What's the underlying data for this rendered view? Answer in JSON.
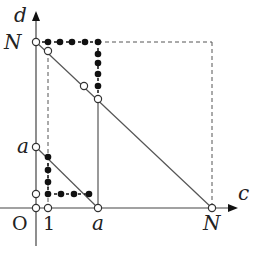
{
  "diagram": {
    "axes": {
      "x_label": "c",
      "y_label": "d",
      "origin_label": "O"
    },
    "tick_labels": {
      "x": [
        {
          "label": "1",
          "italic": false
        },
        {
          "label": "a",
          "italic": true
        },
        {
          "label": "N",
          "italic": true
        }
      ],
      "y": [
        {
          "label": "a",
          "italic": true
        },
        {
          "label": "N",
          "italic": true
        }
      ]
    },
    "lines": [
      {
        "name": "diagonal-N",
        "from": [
          "0",
          "N"
        ],
        "to": [
          "N",
          "0"
        ],
        "style": "solid"
      },
      {
        "name": "diagonal-a",
        "from": [
          "0",
          "a"
        ],
        "to": [
          "a",
          "0"
        ],
        "style": "solid"
      },
      {
        "name": "vertical-a",
        "from": [
          "a",
          "0"
        ],
        "to": [
          "a",
          "N-a"
        ],
        "style": "solid"
      },
      {
        "name": "box-top",
        "at": "d=N",
        "style": "dashed"
      },
      {
        "name": "box-right",
        "at": "c=N",
        "style": "dashed"
      },
      {
        "name": "vertical-1",
        "at": "c=1",
        "style": "dashed"
      }
    ],
    "colors": {
      "line": "#555555",
      "dot": "#111111",
      "open": "#ffffff"
    }
  }
}
